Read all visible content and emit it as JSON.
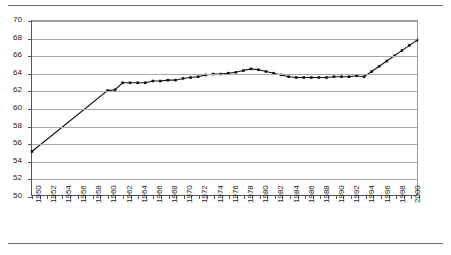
{
  "chart_data": {
    "type": "line",
    "title": "",
    "subtitle": "",
    "xlabel": "",
    "ylabel": "",
    "xlim": [
      1950,
      2001
    ],
    "ylim": [
      50,
      70
    ],
    "y_ticks": [
      50,
      52,
      54,
      56,
      58,
      60,
      62,
      64,
      66,
      68,
      70
    ],
    "x_tick_labels": [
      "1950",
      "1952",
      "1954",
      "1956",
      "1958",
      "1960",
      "1962",
      "1964",
      "1966",
      "1968",
      "1970",
      "1972",
      "1974",
      "1976",
      "1978",
      "1980",
      "1982",
      "1984",
      "1986",
      "1988",
      "1990",
      "1992",
      "1994",
      "1996",
      "1998",
      "2000"
    ],
    "grid": "horizontal",
    "legend": "none",
    "marker": "square",
    "series": [
      {
        "name": "series-1",
        "x": [
          1950,
          1960,
          1961,
          1962,
          1963,
          1964,
          1965,
          1966,
          1967,
          1968,
          1969,
          1970,
          1971,
          1972,
          1973,
          1974,
          1975,
          1976,
          1977,
          1978,
          1979,
          1980,
          1981,
          1982,
          1983,
          1984,
          1985,
          1986,
          1987,
          1988,
          1989,
          1990,
          1991,
          1992,
          1993,
          1994,
          1995,
          1996,
          1997,
          1998,
          1999,
          2000,
          2001
        ],
        "values": [
          55.0,
          62.0,
          62.1,
          62.9,
          62.9,
          62.9,
          62.9,
          63.1,
          63.1,
          63.2,
          63.2,
          63.4,
          63.5,
          63.6,
          63.8,
          63.9,
          63.9,
          64.0,
          64.1,
          64.3,
          64.5,
          64.4,
          64.2,
          64.0,
          63.8,
          63.6,
          63.5,
          63.5,
          63.5,
          63.5,
          63.5,
          63.6,
          63.6,
          63.6,
          63.7,
          63.6,
          64.2,
          64.8,
          65.4,
          66.0,
          66.6,
          67.2,
          67.8
        ]
      }
    ],
    "markers_start_year": 1960
  },
  "axis": {
    "y_unit": "",
    "x_unit": ""
  }
}
